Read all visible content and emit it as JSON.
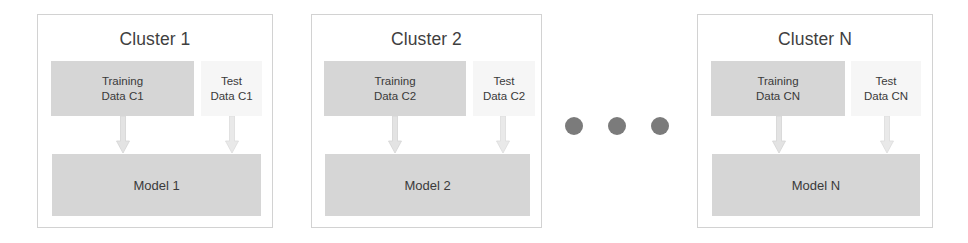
{
  "diagram": {
    "colors": {
      "panel_border": "#d2d2d2",
      "box_fill": "#d6d6d6",
      "test_box_fill": "#f6f6f6",
      "arrow_fill": "#e3e3e3",
      "arrow_stroke": "#cfcfcf",
      "dot_fill": "#7b7b7b",
      "text": "#3a3a3a",
      "background": "#ffffff"
    },
    "clusters": [
      {
        "title": "Cluster 1",
        "training": {
          "line1": "Training",
          "line2": "Data C1"
        },
        "test": {
          "line1": "Test",
          "line2": "Data C1"
        },
        "model": "Model 1",
        "arrow_training": "down-arrow-icon",
        "arrow_test": "down-arrow-icon"
      },
      {
        "title": "Cluster 2",
        "training": {
          "line1": "Training",
          "line2": "Data C2"
        },
        "test": {
          "line1": "Test",
          "line2": "Data C2"
        },
        "model": "Model 2",
        "arrow_training": "down-arrow-icon",
        "arrow_test": "down-arrow-icon"
      },
      {
        "title": "Cluster N",
        "training": {
          "line1": "Training",
          "line2": "Data CN"
        },
        "test": {
          "line1": "Test",
          "line2": "Data CN"
        },
        "model": "Model N",
        "arrow_training": "down-arrow-icon",
        "arrow_test": "down-arrow-icon"
      }
    ],
    "ellipsis": {
      "name": "ellipsis-dots",
      "count": 3,
      "meaning": "additional clusters omitted"
    }
  }
}
